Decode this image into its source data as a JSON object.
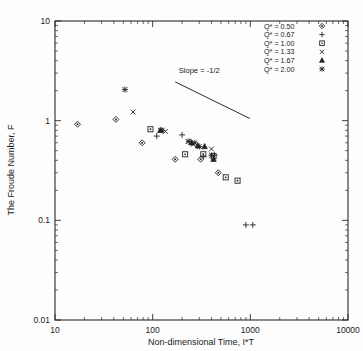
{
  "figure": {
    "background": "#ffffff",
    "marker_color": "#222222"
  },
  "axes": {
    "x": {
      "label": "Non-dimensional Time, I*T",
      "scale": "log",
      "min": 10,
      "max": 10000,
      "ticks": [
        10,
        100,
        1000,
        10000
      ],
      "tick_labels": [
        "10",
        "100",
        "1000",
        "10000"
      ]
    },
    "y": {
      "label": "The Froude Number, F",
      "scale": "log",
      "min": 0.01,
      "max": 10,
      "ticks": [
        0.01,
        0.1,
        1,
        10
      ],
      "tick_labels": [
        "0.01",
        "0.1",
        "1",
        "10"
      ]
    }
  },
  "annotations": [
    {
      "name": "slope-label",
      "text": "Slope = -1/2",
      "x": 300,
      "y": 3.0
    }
  ],
  "legend": {
    "position": "top-right",
    "entries": [
      {
        "label": "Q* = 0.50",
        "marker": "diamond",
        "value": 0.5
      },
      {
        "label": "Q* = 0.67",
        "marker": "plus",
        "value": 0.67
      },
      {
        "label": "Q* = 1.00",
        "marker": "square",
        "value": 1.0
      },
      {
        "label": "Q* = 1.33",
        "marker": "cross",
        "value": 1.33
      },
      {
        "label": "Q* = 1.67",
        "marker": "triangle",
        "value": 1.67
      },
      {
        "label": "Q* = 2.00",
        "marker": "asterisk",
        "value": 2.0
      }
    ]
  },
  "chart_data": {
    "type": "scatter",
    "title": "",
    "xlabel": "Non-dimensional Time, I*T",
    "ylabel": "The Froude Number, F",
    "xscale": "log",
    "yscale": "log",
    "xlim": [
      10,
      10000
    ],
    "ylim": [
      0.01,
      10
    ],
    "grid": false,
    "legend_position": "top-right",
    "reference_line": {
      "label": "Slope = -1/2",
      "slope": -0.5,
      "x": [
        170,
        990
      ],
      "y": [
        2.45,
        1.05
      ]
    },
    "series": [
      {
        "name": "Q* = 0.50",
        "marker": "diamond",
        "x": [
          17,
          42,
          78,
          170,
          310,
          470
        ],
        "y": [
          0.92,
          1.03,
          0.6,
          0.41,
          0.41,
          0.3
        ]
      },
      {
        "name": "Q* = 0.67",
        "marker": "plus",
        "x": [
          110,
          200,
          330,
          430,
          900,
          1060
        ],
        "y": [
          0.7,
          0.72,
          0.44,
          0.45,
          0.09,
          0.09
        ]
      },
      {
        "name": "Q* = 1.00",
        "marker": "square",
        "x": [
          95,
          215,
          330,
          420,
          560,
          740
        ],
        "y": [
          0.82,
          0.46,
          0.46,
          0.44,
          0.27,
          0.25
        ]
      },
      {
        "name": "Q* = 1.33",
        "marker": "cross",
        "x": [
          63,
          120,
          135,
          230,
          260,
          400
        ],
        "y": [
          1.22,
          0.8,
          0.78,
          0.62,
          0.58,
          0.52
        ]
      },
      {
        "name": "Q* = 1.67",
        "marker": "triangle",
        "x": [
          120,
          250,
          290,
          340,
          420
        ],
        "y": [
          0.8,
          0.6,
          0.56,
          0.55,
          0.41
        ]
      },
      {
        "name": "Q* = 2.00",
        "marker": "asterisk",
        "x": [
          52,
          125,
          235,
          270,
          300,
          400
        ],
        "y": [
          2.05,
          0.8,
          0.62,
          0.6,
          0.55,
          0.45
        ]
      }
    ]
  }
}
